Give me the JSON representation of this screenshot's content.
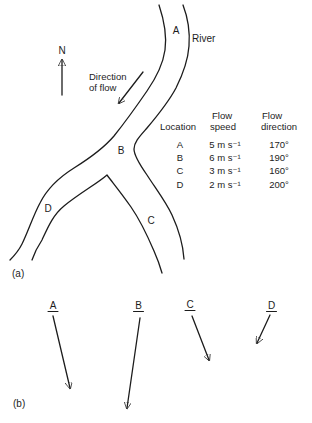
{
  "panel_a": {
    "tag": "(a)",
    "north_label": "N",
    "river_label": "River",
    "flow_label_line1": "Direction",
    "flow_label_line2": "of flow",
    "loc_a": "A",
    "loc_b": "B",
    "loc_c": "C",
    "loc_d": "D",
    "table": {
      "col_location": "Location",
      "col_speed_l1": "Flow",
      "col_speed_l2": "speed",
      "col_dir_l1": "Flow",
      "col_dir_l2": "direction",
      "rows": [
        {
          "location": "A",
          "speed": "5 m s⁻¹",
          "direction": "170°"
        },
        {
          "location": "B",
          "speed": "6 m s⁻¹",
          "direction": "190°"
        },
        {
          "location": "C",
          "speed": "3 m s⁻¹",
          "direction": "160°"
        },
        {
          "location": "D",
          "speed": "2 m s⁻¹",
          "direction": "200°"
        }
      ]
    }
  },
  "panel_b": {
    "tag": "(b)",
    "vector_a": "A",
    "vector_b": "B",
    "vector_c": "C",
    "vector_d": "D"
  },
  "colors": {
    "ink": "#1c1c1c",
    "background": "#ffffff"
  }
}
